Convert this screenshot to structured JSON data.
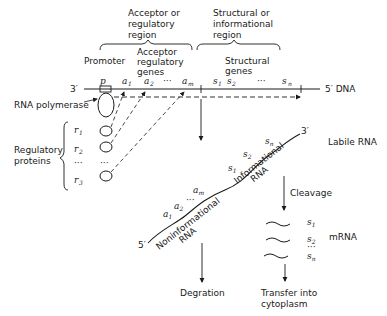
{
  "header": {
    "acceptor_region": [
      "Acceptor or",
      "regulatory",
      "region"
    ],
    "structural_region": [
      "Structural or",
      "informational",
      "region"
    ],
    "promoter": "Promoter",
    "acceptor_genes": [
      "Acceptor",
      "regulatory",
      "genes"
    ],
    "structural_genes": [
      "Structural",
      "genes"
    ]
  },
  "dna": {
    "left_end": "3′",
    "right_end": "5′ DNA",
    "p": "p",
    "a1": "a",
    "a2": "a",
    "am": "a",
    "a1_sub": "1",
    "a2_sub": "2",
    "am_sub": "m",
    "s1": "s",
    "s2": "s",
    "sn": "s",
    "s1_sub": "1",
    "s2_sub": "2",
    "sn_sub": "n",
    "ellipsis": "···"
  },
  "left": {
    "rna_polymerase": "RNA polymerase",
    "regulatory_proteins": [
      "Regulatory",
      "proteins"
    ],
    "r1": "r",
    "r2": "r",
    "r3": "r",
    "r1_sub": "1",
    "r2_sub": "2",
    "r3_sub": "3",
    "ellipsis": "···"
  },
  "rna": {
    "five_prime": "5′",
    "three_prime": "3′",
    "labile": "Labile RNA",
    "noninformational": [
      "Noninformational",
      "RNA"
    ],
    "informational": [
      "Informational",
      "RNA"
    ]
  },
  "flow": {
    "cleavage": "Cleavage",
    "mrna": "mRNA",
    "degradation": "Degration",
    "transfer": [
      "Transfer into",
      "cytoplasm"
    ]
  }
}
